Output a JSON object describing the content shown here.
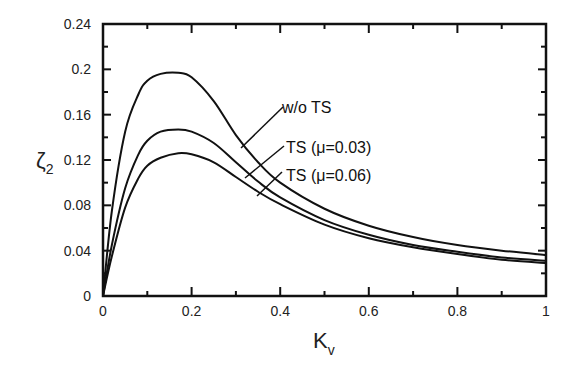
{
  "chart_data": {
    "type": "line",
    "title": "",
    "xlabel": "K",
    "xlabel_sub": "v",
    "ylabel": "ζ",
    "ylabel_sub": "2",
    "xlim": [
      0,
      1
    ],
    "ylim": [
      0,
      0.24
    ],
    "xticks": [
      "0",
      "0.2",
      "0.4",
      "0.6",
      "0.8",
      "1"
    ],
    "yticks": [
      "0",
      "0.04",
      "0.08",
      "0.12",
      "0.16",
      "0.2",
      "0.24"
    ],
    "grid": false,
    "legend_position": "inline annotations",
    "x": [
      0,
      0.02,
      0.05,
      0.08,
      0.1,
      0.13,
      0.17,
      0.2,
      0.25,
      0.3,
      0.35,
      0.4,
      0.5,
      0.6,
      0.7,
      0.8,
      0.9,
      1.0
    ],
    "series": [
      {
        "name": "w/o TS",
        "values": [
          0,
          0.075,
          0.145,
          0.178,
          0.19,
          0.196,
          0.197,
          0.193,
          0.172,
          0.142,
          0.118,
          0.1,
          0.077,
          0.062,
          0.052,
          0.045,
          0.04,
          0.036
        ]
      },
      {
        "name": "TS (μ=0.03)",
        "values": [
          0,
          0.045,
          0.095,
          0.125,
          0.137,
          0.145,
          0.147,
          0.145,
          0.135,
          0.118,
          0.101,
          0.087,
          0.067,
          0.054,
          0.045,
          0.039,
          0.034,
          0.031
        ]
      },
      {
        "name": "TS (μ=0.06)",
        "values": [
          0,
          0.035,
          0.078,
          0.104,
          0.115,
          0.122,
          0.126,
          0.125,
          0.118,
          0.105,
          0.092,
          0.081,
          0.063,
          0.051,
          0.043,
          0.037,
          0.032,
          0.029
        ]
      }
    ],
    "annotations": [
      "w/o TS",
      "TS (μ=0.03)",
      "TS (μ=0.06)"
    ]
  }
}
